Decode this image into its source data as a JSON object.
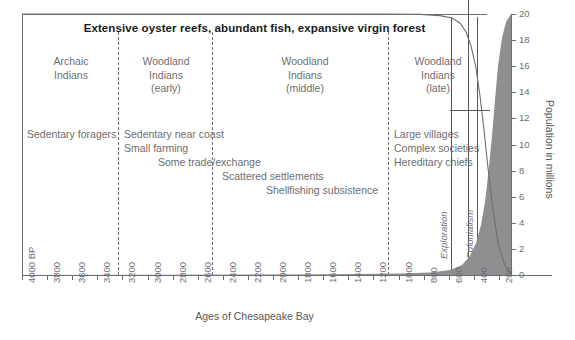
{
  "headline": "Extensive oyster reefs, abundant fish, expansive virgin forest",
  "axes": {
    "x_title": "Ages of Chesapeake Bay",
    "x_ticks": [
      "4000 BP",
      "3800",
      "3600",
      "3400",
      "3200",
      "3000",
      "2800",
      "2600",
      "2400",
      "2200",
      "2000",
      "1800",
      "1600",
      "1400",
      "1200",
      "1000",
      "800",
      "600",
      "400",
      "200"
    ],
    "y_title": "Population in millions",
    "y_ticks": [
      "0",
      "2",
      "4",
      "6",
      "8",
      "10",
      "12",
      "14",
      "16",
      "18",
      "20"
    ]
  },
  "eras": [
    {
      "name": "era-archaic",
      "lines": [
        "Archaic",
        "Indians"
      ]
    },
    {
      "name": "era-woodland-early",
      "lines": [
        "Woodland",
        "Indians",
        "(early)"
      ]
    },
    {
      "name": "era-woodland-middle",
      "lines": [
        "Woodland",
        "Indians",
        "(middle)"
      ]
    },
    {
      "name": "era-woodland-late",
      "lines": [
        "Woodland",
        "Indians",
        "(late)"
      ]
    }
  ],
  "notes": [
    {
      "name": "note-sedentary-foragers",
      "text": "Sedentary foragers"
    },
    {
      "name": "note-sedentary-near-coast",
      "text": "Sedentary near coast"
    },
    {
      "name": "note-small-farming",
      "text": "Small farming"
    },
    {
      "name": "note-some-trade-exchange",
      "text": "Some trade/exchange"
    },
    {
      "name": "note-scattered-settlements",
      "text": "Scattered settlements"
    },
    {
      "name": "note-shellfishing-subsistence",
      "text": "Shellfishing subsistence"
    },
    {
      "name": "note-large-villages",
      "text": "Large villages"
    },
    {
      "name": "note-complex-societies",
      "text": "Complex societies"
    },
    {
      "name": "note-hereditary-chiefs",
      "text": "Hereditary chiefs"
    }
  ],
  "periods": [
    {
      "name": "period-exploration",
      "label": "Exploration"
    },
    {
      "name": "period-colonialism",
      "label": "Colonialism"
    }
  ],
  "colors": {
    "ink": "#58585a",
    "axis": "#6d6e71",
    "fill": "#8e8f91",
    "curve": "#6d6e71"
  },
  "chart_data": {
    "type": "area",
    "title": "Extensive oyster reefs, abundant fish, expansive virgin forest",
    "xlabel": "Ages of Chesapeake Bay",
    "ylabel": "Population in millions",
    "xlim": [
      4000,
      0
    ],
    "ylim": [
      0,
      20
    ],
    "x_tick_values": [
      4000,
      3800,
      3600,
      3400,
      3200,
      3000,
      2800,
      2600,
      2400,
      2200,
      2000,
      1800,
      1600,
      1400,
      1200,
      1000,
      800,
      600,
      400,
      200
    ],
    "y_tick_values": [
      0,
      2,
      4,
      6,
      8,
      10,
      12,
      14,
      16,
      18,
      20
    ],
    "grid": false,
    "legend": "none",
    "series": [
      {
        "name": "Population in millions",
        "style": "filled-area",
        "x": [
          4000,
          3000,
          2000,
          1500,
          1000,
          800,
          600,
          500,
          400,
          350,
          300,
          250,
          200,
          150,
          100,
          50,
          20,
          0
        ],
        "y": [
          0.01,
          0.02,
          0.03,
          0.04,
          0.05,
          0.06,
          0.08,
          0.1,
          0.15,
          0.25,
          0.45,
          0.9,
          1.8,
          3.6,
          6.5,
          11.0,
          15.5,
          20.0
        ]
      },
      {
        "name": "Natural resource abundance (oyster reefs, fish, forest)",
        "style": "line",
        "x": [
          4000,
          1000,
          600,
          450,
          400,
          350,
          300,
          250,
          200,
          150,
          100,
          50,
          0
        ],
        "y": [
          20.0,
          20.0,
          19.9,
          19.6,
          19.0,
          17.5,
          15.0,
          12.0,
          9.0,
          6.0,
          3.5,
          1.5,
          0.2
        ]
      }
    ],
    "annotations": [
      {
        "text": "Archaic Indians",
        "x_range": [
          4000,
          3200
        ]
      },
      {
        "text": "Woodland Indians (early)",
        "x_range": [
          3200,
          2400
        ]
      },
      {
        "text": "Woodland Indians (middle)",
        "x_range": [
          2400,
          1100
        ]
      },
      {
        "text": "Woodland Indians (late)",
        "x_range": [
          1100,
          400
        ]
      },
      {
        "text": "Exploration",
        "x": 450
      },
      {
        "text": "Colonialism",
        "x": 330
      }
    ]
  }
}
